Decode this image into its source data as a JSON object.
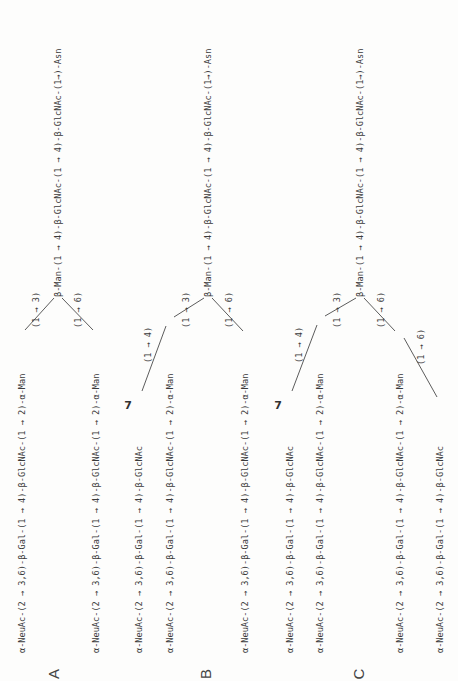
{
  "figure": {
    "orientation": "rotated 90 degrees counter-clockwise",
    "panels": [
      {
        "label": "A",
        "trunk": "β-Man-(1 → 4)-β-GlcNAc-(1 → 4)-β-GlcNAc-(1→)-Asn",
        "branch_labels": [
          "(1 → 3)",
          "(1 → 6)"
        ],
        "arms": [
          "α-NeuAc-(2 → 3,6)-β-Gal-(1 → 4)-β-GlcNAc-(1 → 2)-α-Man",
          "α-NeuAc-(2 → 3,6)-β-Gal-(1 → 4)-β-GlcNAc-(1 → 2)-α-Man"
        ]
      },
      {
        "label": "B",
        "trunk": "β-Man-(1 → 4)-β-GlcNAc-(1 → 4)-β-GlcNAc-(1→)-Asn",
        "branch_labels": [
          "(1 → 3)",
          "(1 → 6)"
        ],
        "extra_branch_label": "(1 → 4)",
        "marker": "7",
        "arms": [
          "α-NeuAc-(2 → 3,6)-β-Gal-(1 → 4)-β-GlcNAc",
          "α-NeuAc-(2 → 3,6)-β-Gal-(1 → 4)-β-GlcNAc-(1 → 2)-α-Man",
          "α-NeuAc-(2 → 3,6)-β-Gal-(1 → 4)-β-GlcNAc-(1 → 2)-α-Man"
        ]
      },
      {
        "label": "C",
        "trunk": "β-Man-(1 → 4)-β-GlcNAc-(1 → 4)-β-GlcNAc-(1→)-Asn",
        "branch_labels": [
          "(1 → 3)",
          "(1 → 6)"
        ],
        "extra_branch_label": "(1 → 4)",
        "extra_branch_label_2": "(1 → 6)",
        "marker": "7",
        "arms": [
          "α-NeuAc-(2 → 3,6)-β-Gal-(1 → 4)-β-GlcNAc",
          "α-NeuAc-(2 → 3,6)-β-Gal-(1 → 4)-β-GlcNAc-(1 → 2)-α-Man",
          "α-NeuAc-(2 → 3,6)-β-Gal-(1 → 4)-β-GlcNAc-(1 → 2)-α-Man",
          "α-NeuAc-(2 → 3,6)-β-Gal-(1 → 4)-β-GlcNAc"
        ]
      }
    ]
  }
}
